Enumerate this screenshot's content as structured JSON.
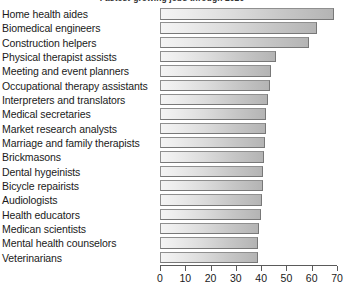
{
  "chart_data": {
    "type": "bar",
    "orientation": "horizontal",
    "title": "Fastest-growing jobs through 2020",
    "xlabel": "",
    "ylabel": "",
    "xlim": [
      0,
      70
    ],
    "xticks": [
      0,
      10,
      20,
      30,
      40,
      50,
      60,
      70
    ],
    "grid": false,
    "legend": null,
    "categories": [
      "Home health aides",
      "Biomedical engineers",
      "Construction helpers",
      "Physical therapist assists",
      "Meeting and event planners",
      "Occupational therapy assistants",
      "Interpreters and translators",
      "Medical secretaries",
      "Market research analysts",
      "Marriage and family therapists",
      "Brickmasons",
      "Dental hygeinists",
      "Bicycle repairists",
      "Audiologists",
      "Health educators",
      "Medican scientists",
      "Mental health counselors",
      "Veterinarians"
    ],
    "values": [
      69,
      62,
      59,
      46,
      44,
      43.5,
      42.7,
      42,
      42,
      41.5,
      41,
      40.7,
      40.7,
      40.4,
      40,
      39.2,
      38.9,
      38.7
    ]
  },
  "colors": {
    "bar_fill_light": "#f4f4f4",
    "bar_fill_dark": "#b4b4b4",
    "bar_border": "#8f8f8f",
    "axis": "#5a5a5a",
    "text": "#1a1a1a",
    "background": "#ffffff"
  }
}
